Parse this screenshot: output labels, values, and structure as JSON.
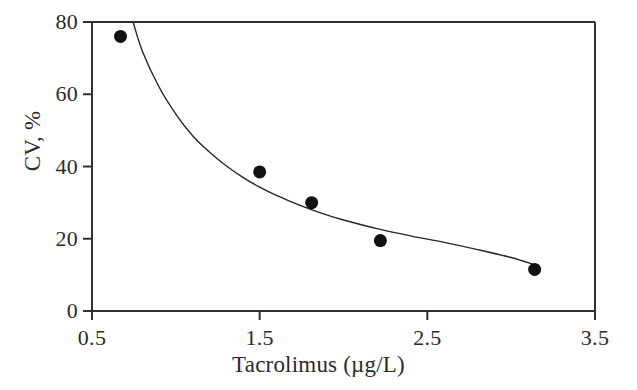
{
  "chart_data": {
    "type": "scatter",
    "title": "",
    "subtitle": "",
    "xlabel": "Tacrolimus (µg/L)",
    "ylabel": "CV, %",
    "xlim": [
      0.5,
      3.5
    ],
    "ylim": [
      0,
      80
    ],
    "xticks": [
      0.5,
      1.5,
      2.5,
      3.5
    ],
    "xtick_labels": [
      "0.5",
      "1.5",
      "2.5",
      "3.5"
    ],
    "yticks": [
      0,
      20,
      40,
      60,
      80
    ],
    "ytick_labels": [
      "0",
      "20",
      "40",
      "60",
      "80"
    ],
    "grid": false,
    "legend": null,
    "marker": {
      "shape": "circle",
      "color": "#111111",
      "size": 13
    },
    "series": [
      {
        "name": "Observed CV",
        "type": "scatter",
        "points": [
          {
            "x": 0.67,
            "y": 76.0
          },
          {
            "x": 1.5,
            "y": 38.5
          },
          {
            "x": 1.81,
            "y": 30.0
          },
          {
            "x": 2.22,
            "y": 19.5
          },
          {
            "x": 3.14,
            "y": 11.5
          }
        ]
      },
      {
        "name": "Fitted power curve",
        "type": "line",
        "color": "#262626",
        "line_width": 1.4,
        "points": [
          {
            "x": 0.745,
            "y": 80.0
          },
          {
            "x": 0.8,
            "y": 72.0
          },
          {
            "x": 0.9,
            "y": 62.0
          },
          {
            "x": 1.0,
            "y": 54.5
          },
          {
            "x": 1.1,
            "y": 48.5
          },
          {
            "x": 1.2,
            "y": 44.0
          },
          {
            "x": 1.3,
            "y": 40.2
          },
          {
            "x": 1.4,
            "y": 37.0
          },
          {
            "x": 1.5,
            "y": 34.3
          },
          {
            "x": 1.6,
            "y": 32.0
          },
          {
            "x": 1.7,
            "y": 30.0
          },
          {
            "x": 1.8,
            "y": 28.2
          },
          {
            "x": 1.9,
            "y": 26.6
          },
          {
            "x": 2.0,
            "y": 25.2
          },
          {
            "x": 2.2,
            "y": 22.8
          },
          {
            "x": 2.4,
            "y": 20.8
          },
          {
            "x": 2.6,
            "y": 19.0
          },
          {
            "x": 2.8,
            "y": 17.0
          },
          {
            "x": 3.0,
            "y": 14.8
          },
          {
            "x": 3.14,
            "y": 12.8
          }
        ]
      }
    ]
  },
  "axes": {
    "frame_color": "#303030",
    "tick_direction": "out",
    "spines": [
      "left",
      "bottom",
      "top",
      "right"
    ]
  }
}
